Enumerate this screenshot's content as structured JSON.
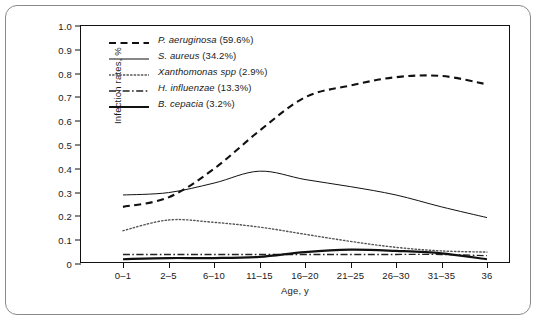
{
  "chart_data": {
    "type": "line",
    "title": "",
    "xlabel": "Age, y",
    "ylabel": "Infection rates, %",
    "categories": [
      "0–1",
      "2–5",
      "6–10",
      "11–15",
      "16–20",
      "21–25",
      "26–30",
      "31–35",
      "36"
    ],
    "ylim": [
      0,
      1.0
    ],
    "yticks": [
      "0",
      "0.1",
      "0.2",
      "0.3",
      "0.4",
      "0.5",
      "0.6",
      "0.7",
      "0.8",
      "0.9",
      "1.0"
    ],
    "ytick_values": [
      0,
      0.1,
      0.2,
      0.3,
      0.4,
      0.5,
      0.6,
      0.7,
      0.8,
      0.9,
      1.0
    ],
    "grid": false,
    "legend_position": "top-left",
    "series": [
      {
        "name": "P. aeruginosa",
        "percent": "59.6%",
        "legend_label": "P. aeruginosa (59.6%)",
        "style": "dashed",
        "color": "#111111",
        "values": [
          0.24,
          0.28,
          0.4,
          0.56,
          0.7,
          0.75,
          0.785,
          0.79,
          0.755
        ]
      },
      {
        "name": "S. aureus",
        "percent": "34.2%",
        "legend_label": "S. aureus (34.2%)",
        "style": "solid-thin",
        "color": "#111111",
        "values": [
          0.29,
          0.3,
          0.34,
          0.39,
          0.355,
          0.325,
          0.29,
          0.24,
          0.195
        ]
      },
      {
        "name": "Xanthomonas spp",
        "percent": "2.9%",
        "legend_label": "Xanthomonas spp (2.9%)",
        "style": "dotted",
        "color": "#555555",
        "values": [
          0.14,
          0.185,
          0.175,
          0.155,
          0.125,
          0.095,
          0.07,
          0.055,
          0.05
        ]
      },
      {
        "name": "H. influenzae",
        "percent": "13.3%",
        "legend_label": "H. influenzae (13.3%)",
        "style": "dash-dot",
        "color": "#222222",
        "values": [
          0.04,
          0.04,
          0.04,
          0.04,
          0.04,
          0.04,
          0.04,
          0.04,
          0.035
        ]
      },
      {
        "name": "B. cepacia",
        "percent": "3.2%",
        "legend_label": "B. cepacia (3.2%)",
        "style": "solid-thick",
        "color": "#111111",
        "values": [
          0.02,
          0.025,
          0.025,
          0.03,
          0.05,
          0.06,
          0.055,
          0.045,
          0.02
        ]
      }
    ]
  }
}
